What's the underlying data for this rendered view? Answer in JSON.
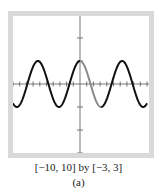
{
  "chart_data": {
    "type": "line",
    "title": "",
    "function": "y = cos(x)",
    "xlabel": "",
    "ylabel": "",
    "xlim": [
      -10,
      10
    ],
    "ylim": [
      -3,
      3
    ],
    "xscale_ticks": 1,
    "yscale_ticks": 1,
    "grid": false,
    "legend": null,
    "series": [
      {
        "name": "cos(x)",
        "x_from": -10,
        "x_to": 10,
        "color": "#111111"
      },
      {
        "name": "cos(x) highlighted segment",
        "x_from": 0,
        "x_to": 3.14159,
        "color": "#8a8a8a"
      }
    ],
    "x": [
      -10,
      -9,
      -8,
      -7,
      -6,
      -5,
      -4,
      -3,
      -2,
      -1,
      0,
      1,
      2,
      3,
      4,
      5,
      6,
      7,
      8,
      9,
      10
    ],
    "values": [
      -0.839,
      -0.911,
      -0.146,
      0.754,
      0.96,
      0.284,
      -0.654,
      -0.99,
      -0.416,
      0.54,
      1.0,
      0.54,
      -0.416,
      -0.99,
      -0.654,
      0.284,
      0.96,
      0.754,
      -0.146,
      -0.911,
      -0.839
    ]
  },
  "caption": {
    "window": "[−10, 10] by [−3, 3]",
    "label": "(a)"
  },
  "colors": {
    "frame": "#d9d9d9",
    "axis": "#555555",
    "curve": "#111111",
    "highlight": "#8a8a8a"
  }
}
